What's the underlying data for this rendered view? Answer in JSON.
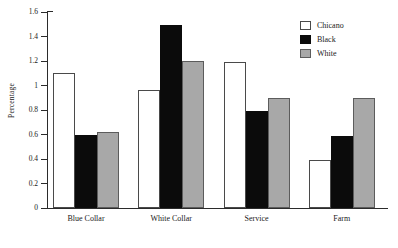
{
  "chart_data": {
    "type": "bar",
    "title": "",
    "xlabel": "",
    "ylabel": "Percentage",
    "categories": [
      "Blue Collar",
      "White Collar",
      "Service",
      "Farm"
    ],
    "series": [
      {
        "name": "Chicano",
        "color": "#ffffff",
        "values": [
          1.1,
          0.96,
          1.19,
          0.39
        ]
      },
      {
        "name": "Black",
        "color": "#0b0b0b",
        "values": [
          0.6,
          1.49,
          0.79,
          0.59
        ]
      },
      {
        "name": "White",
        "color": "#a8a8a8",
        "values": [
          0.62,
          1.2,
          0.9,
          0.9
        ]
      }
    ],
    "ylim": [
      0,
      1.6
    ],
    "ytick_labels": [
      "0",
      "0.2",
      "0.4",
      "0.6",
      "0.8",
      "1",
      "1.2",
      "1.4",
      "1.6"
    ],
    "ytick_values": [
      0,
      0.2,
      0.4,
      0.6,
      0.8,
      1.0,
      1.2,
      1.4,
      1.6
    ],
    "grid": false,
    "legend_position": "top-right"
  }
}
